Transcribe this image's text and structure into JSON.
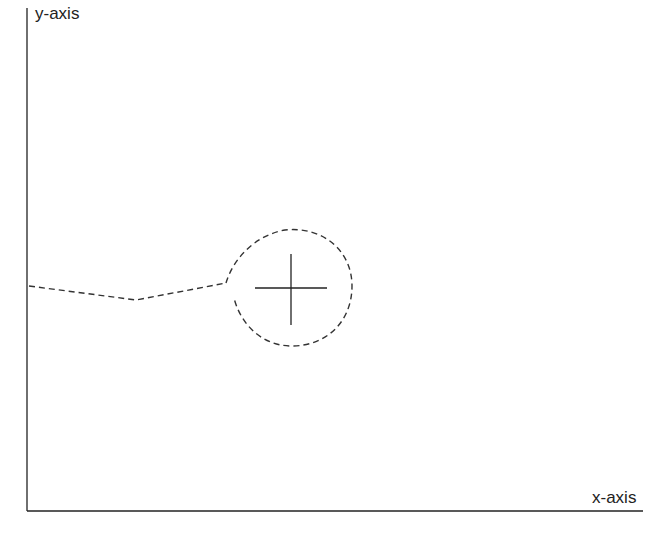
{
  "diagram": {
    "x_axis_label": "x-axis",
    "y_axis_label": "y-axis",
    "elements": [
      {
        "type": "axis",
        "name": "y-axis",
        "from": [
          27,
          8
        ],
        "to": [
          27,
          511
        ]
      },
      {
        "type": "axis",
        "name": "x-axis",
        "from": [
          27,
          511
        ],
        "to": [
          643,
          511
        ]
      },
      {
        "type": "dashed-path",
        "name": "trajectory",
        "points": [
          [
            29,
            286
          ],
          [
            136,
            300
          ],
          [
            226,
            283
          ]
        ]
      },
      {
        "type": "dashed-loop",
        "name": "loop-around-point",
        "center": [
          290,
          287
        ],
        "radius": 60
      },
      {
        "type": "crosshair",
        "name": "target-point",
        "center": [
          291,
          288
        ],
        "half_width": 36,
        "half_height": 36
      }
    ]
  },
  "colors": {
    "line": "#222222",
    "dash": "#333333",
    "background": "#ffffff"
  }
}
